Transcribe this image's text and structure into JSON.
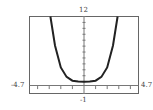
{
  "chart_data": {
    "type": "line",
    "title": "",
    "xlabel": "",
    "ylabel": "",
    "xlim": [
      -4.7,
      4.7
    ],
    "ylim": [
      -1,
      12
    ],
    "window_labels": {
      "xmin": "-4.7",
      "xmax": "4.7",
      "ymin": "-1",
      "ymax": "12"
    },
    "grid": false,
    "x_ticks_step": 1,
    "y_ticks_step": 1,
    "series": [
      {
        "name": "curve",
        "x": [
          -2.9,
          -2.5,
          -2.0,
          -1.5,
          -1.0,
          -0.5,
          0,
          0.5,
          1.0,
          1.5,
          2.0,
          2.5,
          2.9
        ],
        "y": [
          12.0,
          7.1,
          3.4,
          1.8,
          1.16,
          1.01,
          1.0,
          1.01,
          1.16,
          1.8,
          3.4,
          7.1,
          12.0
        ]
      }
    ]
  }
}
